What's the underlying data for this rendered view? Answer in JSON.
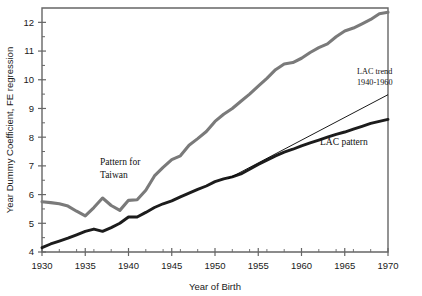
{
  "chart_data": {
    "type": "line",
    "title": "",
    "xlabel": "Year of Birth",
    "ylabel": "Year Dummy Coefficient, FE regression",
    "xlim": [
      1930,
      1970
    ],
    "ylim": [
      4,
      12.5
    ],
    "xticks": [
      1930,
      1935,
      1940,
      1945,
      1950,
      1955,
      1960,
      1965,
      1970
    ],
    "xtick_labels": [
      "1930",
      "1935",
      "1940",
      "1945",
      "1950",
      "1955",
      "1960",
      "1965",
      "1970"
    ],
    "xminor_step": 1,
    "yticks": [
      4,
      5,
      6,
      7,
      8,
      9,
      10,
      11,
      12
    ],
    "ytick_labels": [
      "4",
      "5",
      "6",
      "7",
      "8",
      "9",
      "10",
      "11",
      "12"
    ],
    "yminor_step": 0.5,
    "grid": false,
    "legend": "none",
    "colors": {
      "taiwan": "#7a7a7a",
      "lac": "#1c1c1c",
      "trend": "#000000",
      "axis": "#666666"
    },
    "x": [
      1930,
      1931,
      1932,
      1933,
      1934,
      1935,
      1936,
      1937,
      1938,
      1939,
      1940,
      1941,
      1942,
      1943,
      1944,
      1945,
      1946,
      1947,
      1948,
      1949,
      1950,
      1951,
      1952,
      1953,
      1954,
      1955,
      1956,
      1957,
      1958,
      1959,
      1960,
      1961,
      1962,
      1963,
      1964,
      1965,
      1966,
      1967,
      1968,
      1969,
      1970
    ],
    "series": [
      {
        "name": "Pattern for Taiwan",
        "values": [
          5.75,
          5.72,
          5.68,
          5.6,
          5.42,
          5.26,
          5.55,
          5.88,
          5.62,
          5.45,
          5.8,
          5.82,
          6.15,
          6.65,
          6.95,
          7.22,
          7.35,
          7.72,
          7.95,
          8.2,
          8.55,
          8.8,
          9.0,
          9.25,
          9.5,
          9.78,
          10.05,
          10.35,
          10.55,
          10.6,
          10.75,
          10.95,
          11.12,
          11.25,
          11.5,
          11.7,
          11.8,
          11.95,
          12.1,
          12.3,
          12.35
        ]
      },
      {
        "name": "LAC pattern",
        "values": [
          4.15,
          4.28,
          4.38,
          4.48,
          4.6,
          4.72,
          4.8,
          4.72,
          4.85,
          5.0,
          5.22,
          5.22,
          5.38,
          5.55,
          5.68,
          5.78,
          5.92,
          6.05,
          6.18,
          6.3,
          6.45,
          6.55,
          6.62,
          6.72,
          6.88,
          7.05,
          7.2,
          7.35,
          7.48,
          7.58,
          7.7,
          7.8,
          7.9,
          8.0,
          8.1,
          8.18,
          8.28,
          8.38,
          8.48,
          8.55,
          8.62
        ]
      }
    ],
    "trend_line": {
      "name": "LAC trend 1940-1960",
      "x0": 1951.5,
      "y0": 6.55,
      "x1": 1970,
      "y1": 9.48
    }
  },
  "annotations": {
    "taiwan_label_line1": "Pattern for",
    "taiwan_label_line2": "Taiwan",
    "lac_pattern_label": "LAC pattern",
    "lac_trend_line1": "LAC trend",
    "lac_trend_line2": "1940-1960"
  },
  "axis": {
    "x_title": "Year of Birth",
    "y_title": "Year Dummy Coefficient, FE regression"
  }
}
